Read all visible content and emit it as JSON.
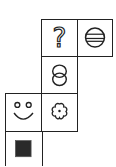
{
  "puzzle": {
    "type": "shape-grid",
    "cells": [
      {
        "id": "question",
        "row": 0,
        "col": 1,
        "symbol": "question-mark",
        "glyph": "?"
      },
      {
        "id": "circle-lines",
        "row": 0,
        "col": 2,
        "symbol": "circle-with-horizontal-lines"
      },
      {
        "id": "two-circles",
        "row": 1,
        "col": 1,
        "symbol": "two-overlapping-circles"
      },
      {
        "id": "smiley",
        "row": 2,
        "col": 0,
        "symbol": "smiley-face"
      },
      {
        "id": "flower",
        "row": 2,
        "col": 1,
        "symbol": "five-petal-flower"
      },
      {
        "id": "square",
        "row": 3,
        "col": 0,
        "symbol": "filled-black-square"
      }
    ]
  },
  "colors": {
    "line": "#222222",
    "fill": "#2a2a2a",
    "background": "#ffffff"
  }
}
